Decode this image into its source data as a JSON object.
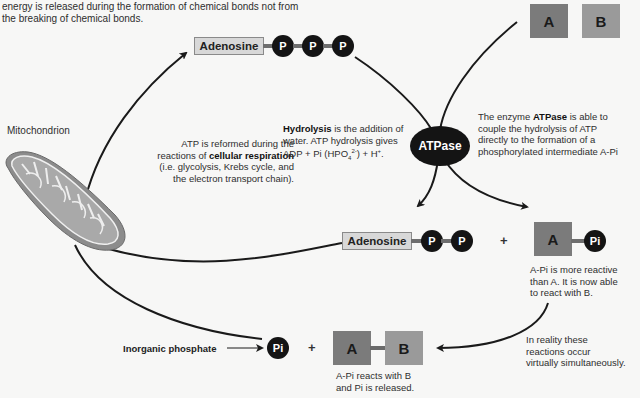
{
  "intro_text": {
    "line1": "energy is released during the formation of chemical bonds not from",
    "line2": "the breaking of chemical bonds."
  },
  "atp": {
    "adenosine_label": "Adenosine",
    "phosphates": [
      "P",
      "P",
      "P"
    ]
  },
  "substrates": {
    "a_label": "A",
    "b_label": "B"
  },
  "mitochondrion": {
    "label": "Mitochondrion"
  },
  "respiration_note": {
    "line1": "ATP is reformed during the",
    "line2_prefix": "reactions of ",
    "line2_bold": "cellular respiration",
    "line3": "(i.e. glycolysis, Krebs cycle, and",
    "line4": "the electron transport chain)."
  },
  "hydrolysis_note": {
    "bold": "Hydrolysis",
    "line1_rest": " is the addition of",
    "line2": "water. ATP hydrolysis gives",
    "line3_prefix": "ADP + Pi (HPO",
    "sub": "4",
    "sup": "2-",
    "line3_suffix": ") + H",
    "sup2": "+",
    "line3_end": "."
  },
  "enzyme": {
    "label": "ATPase"
  },
  "atpase_note": {
    "line1_prefix": "The enzyme ",
    "line1_bold": "ATPase",
    "line1_rest": " is able to",
    "line2": "couple the hydrolysis of ATP",
    "line3": "directly to the formation of a",
    "line4": "phosphorylated intermediate A-Pi"
  },
  "adp": {
    "adenosine_label": "Adenosine",
    "phosphates": [
      "P",
      "P"
    ],
    "plus": "+"
  },
  "intermediate": {
    "a_label": "A",
    "pi_label": "Pi",
    "note_line1": "A-Pi is more reactive",
    "note_line2": "than A. It is now able",
    "note_line3": "to react with B."
  },
  "simultaneous_note": {
    "line1": "In reality these",
    "line2": "reactions occur",
    "line3": "virtually simultaneously."
  },
  "products": {
    "inorganic_phosphate_label": "Inorganic phosphate",
    "pi_label": "Pi",
    "plus": "+",
    "a_label": "A",
    "b_label": "B",
    "note_line1": "A-Pi reacts with B",
    "note_line2": "and Pi is released."
  },
  "colors": {
    "background": "#f7f7f6",
    "phosphate_circle": "#141414",
    "adenosine_box": "#d8d8d8",
    "square_a": "#7b7b7b",
    "square_b": "#9a9a9a",
    "bond": "#6e6e6e",
    "arrow": "#1a1a1a"
  }
}
